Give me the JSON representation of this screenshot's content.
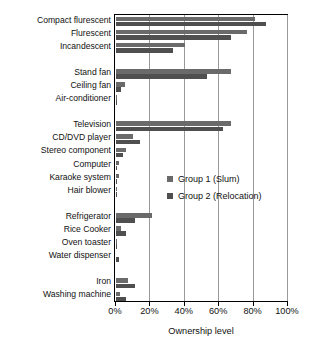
{
  "chart_data": {
    "type": "bar",
    "orientation": "horizontal",
    "title": "",
    "xlabel": "Ownership level",
    "ylabel": "",
    "xlim": [
      0,
      100
    ],
    "xticks": [
      0,
      20,
      40,
      60,
      80,
      100
    ],
    "xtick_labels": [
      "0%",
      "20%",
      "40%",
      "60%",
      "80%",
      "100%"
    ],
    "grid": true,
    "legend_position": "inside-lower-center",
    "categories": [
      "Compact flurescent",
      "Flurescent",
      "Incandescent",
      "",
      "Stand fan",
      "Ceiling fan",
      "Air-conditioner",
      "",
      "Television",
      "CD/DVD player",
      "Stereo component",
      "Computer",
      "Karaoke system",
      "Hair blower",
      "",
      "Refrigerator",
      "Rice Cooker",
      "Oven toaster",
      "Water dispenser",
      "",
      "Iron",
      "Washing machine"
    ],
    "series": [
      {
        "name": "Group 1 (Slum)",
        "color": "#6a6a6a",
        "values": [
          81,
          76,
          40,
          null,
          67,
          5,
          0.5,
          null,
          67,
          10,
          6,
          1.5,
          1.5,
          0.4,
          null,
          21,
          3,
          0.4,
          0,
          null,
          7,
          2.5
        ]
      },
      {
        "name": "Group 2 (Relocation)",
        "color": "#4f4f4f",
        "values": [
          87,
          67,
          33,
          null,
          53,
          3,
          0.3,
          null,
          62,
          14,
          4,
          0.8,
          0.6,
          0.3,
          null,
          11,
          6,
          0.3,
          2,
          null,
          11,
          6
        ]
      }
    ],
    "legend": [
      {
        "label": "Group 1 (Slum)",
        "color": "#6a6a6a"
      },
      {
        "label": "Group 2 (Relocation)",
        "color": "#4f4f4f"
      }
    ]
  }
}
